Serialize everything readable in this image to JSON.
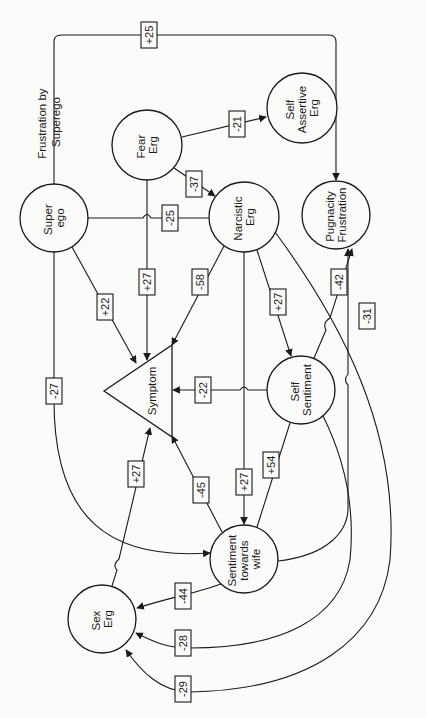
{
  "diagram": {
    "type": "path-diagram",
    "orientation": "rotated-90",
    "nodes": [
      {
        "id": "superego",
        "label_lines": [
          "Super",
          "ego"
        ],
        "shape": "circle"
      },
      {
        "id": "fear",
        "label_lines": [
          "Fear",
          "Erg"
        ],
        "shape": "circle"
      },
      {
        "id": "selfassert",
        "label_lines": [
          "Self",
          "Assertive",
          "Erg"
        ],
        "shape": "circle"
      },
      {
        "id": "narcistic",
        "label_lines": [
          "Narcistic",
          "Erg"
        ],
        "shape": "circle"
      },
      {
        "id": "pugnacity",
        "label_lines": [
          "Pugnacity",
          "Frustration"
        ],
        "shape": "circle"
      },
      {
        "id": "symptom",
        "label_lines": [
          "Symptom"
        ],
        "shape": "triangle"
      },
      {
        "id": "selfsent",
        "label_lines": [
          "Self",
          "Sentiment"
        ],
        "shape": "circle"
      },
      {
        "id": "wife",
        "label_lines": [
          "Sentiment",
          "towards",
          "wife"
        ],
        "shape": "circle"
      },
      {
        "id": "sex",
        "label_lines": [
          "Sex",
          "Erg"
        ],
        "shape": "circle"
      }
    ],
    "annotation": {
      "lines": [
        "Frustration by",
        "Superego"
      ]
    },
    "edges": [
      {
        "from": "superego",
        "to": "pugnacity",
        "weight": "+25"
      },
      {
        "from": "fear",
        "to": "selfassert",
        "weight": "-21"
      },
      {
        "from": "fear",
        "to": "narcistic",
        "weight": "-37"
      },
      {
        "from": "superego",
        "to": "narcistic",
        "weight": "-25"
      },
      {
        "from": "fear",
        "to": "symptom",
        "weight": "+27"
      },
      {
        "from": "superego",
        "to": "symptom",
        "weight": "+22"
      },
      {
        "from": "narcistic",
        "to": "symptom",
        "weight": "-58"
      },
      {
        "from": "narcistic",
        "to": "selfsent",
        "weight": "+27"
      },
      {
        "from": "selfsent",
        "to": "pugnacity",
        "weight": "-42"
      },
      {
        "from": "wife",
        "to": "pugnacity",
        "weight": "-31"
      },
      {
        "from": "selfsent",
        "to": "symptom",
        "weight": "-22"
      },
      {
        "from": "superego",
        "to": "wife",
        "weight": "-27"
      },
      {
        "from": "narcistic",
        "to": "wife",
        "weight": "+27"
      },
      {
        "from": "selfsent",
        "to": "wife",
        "weight": "+54"
      },
      {
        "from": "wife",
        "to": "symptom",
        "weight": "-45"
      },
      {
        "from": "sex",
        "to": "symptom",
        "weight": "+27"
      },
      {
        "from": "wife",
        "to": "sex",
        "weight": "-44"
      },
      {
        "from": "selfsent",
        "to": "sex",
        "weight": "-28"
      },
      {
        "from": "narcistic",
        "to": "sex",
        "weight": "-29"
      }
    ]
  }
}
